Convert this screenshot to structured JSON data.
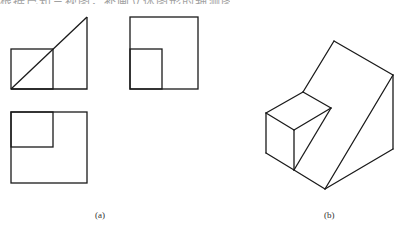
{
  "caption_fragment": "根据已知三视图，补画立体图形的轴测图",
  "figure_a": {
    "label": "(a)",
    "front_view": {
      "outline": [
        [
          11,
          89
        ],
        [
          87,
          89
        ],
        [
          87,
          17
        ]
      ],
      "diagonal": [
        [
          11,
          89
        ],
        [
          87,
          17
        ]
      ],
      "inner_rect": {
        "x": 11,
        "y": 49,
        "w": 42,
        "h": 40
      }
    },
    "side_view": {
      "outer_rect": {
        "x": 130,
        "y": 17,
        "w": 68,
        "h": 72
      },
      "inner_rect": {
        "x": 130,
        "y": 49,
        "w": 32,
        "h": 40
      }
    },
    "top_view": {
      "outer_rect": {
        "x": 11,
        "y": 112,
        "w": 76,
        "h": 71
      },
      "inner_rect": {
        "x": 11,
        "y": 112,
        "w": 42,
        "h": 35
      }
    }
  },
  "figure_b": {
    "label": "(b)",
    "edges": [
      [
        [
          334,
          41
        ],
        [
          393,
          75
        ]
      ],
      [
        [
          393,
          75
        ],
        [
          393,
          149
        ]
      ],
      [
        [
          393,
          149
        ],
        [
          325,
          189
        ]
      ],
      [
        [
          393,
          75
        ],
        [
          325,
          189
        ]
      ],
      [
        [
          334,
          41
        ],
        [
          303,
          92
        ]
      ],
      [
        [
          303,
          92
        ],
        [
          331,
          108
        ]
      ],
      [
        [
          303,
          92
        ],
        [
          266,
          113
        ]
      ],
      [
        [
          266,
          113
        ],
        [
          294,
          130
        ]
      ],
      [
        [
          294,
          130
        ],
        [
          331,
          108
        ]
      ],
      [
        [
          266,
          113
        ],
        [
          266,
          153
        ]
      ],
      [
        [
          294,
          130
        ],
        [
          294,
          170
        ]
      ],
      [
        [
          266,
          153
        ],
        [
          294,
          170
        ]
      ],
      [
        [
          294,
          170
        ],
        [
          325,
          189
        ]
      ],
      [
        [
          331,
          108
        ],
        [
          294,
          170
        ]
      ]
    ]
  },
  "style": {
    "stroke": "#1a1a1a",
    "stroke_width": 1.3
  }
}
